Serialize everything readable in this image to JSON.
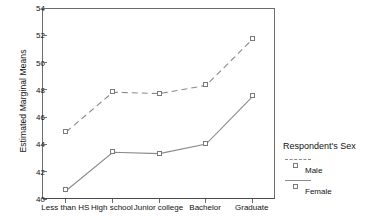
{
  "chart_data": {
    "type": "line",
    "title": "",
    "xlabel": "",
    "ylabel": "Estimated Marginal Means",
    "categories": [
      "Less than HS",
      "High school",
      "Junior college",
      "Bachelor",
      "Graduate"
    ],
    "series": [
      {
        "name": "Male",
        "values": [
          45.0,
          47.9,
          47.8,
          48.4,
          51.8
        ],
        "style": "dashed",
        "marker": "open-square"
      },
      {
        "name": "Female",
        "values": [
          40.7,
          43.5,
          43.4,
          44.1,
          47.6
        ],
        "style": "solid",
        "marker": "open-square"
      }
    ],
    "ylim": [
      40,
      54
    ],
    "yticks": [
      40,
      42,
      44,
      46,
      48,
      50,
      52,
      54
    ],
    "ytick_labels": [
      "40",
      "42",
      "44",
      "46",
      "48",
      "50",
      "52",
      "54"
    ],
    "grid": false,
    "legend_position": "right",
    "legend_title": "Respondent's Sex",
    "line_color": "#8a8a8a",
    "axis_color": "#6b6b6b",
    "marker_color": "#7a7a7a",
    "background": "#ffffff"
  }
}
